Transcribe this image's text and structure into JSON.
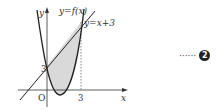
{
  "figure": {
    "curve_label": "y=f(x)",
    "line_label": "y=x+3",
    "x_axis_label": "x",
    "y_axis_label": "y",
    "origin_label": "O",
    "x_tick": "3",
    "y_tick": "3",
    "shading_color": "#d9d9d9",
    "stroke_color": "#222222"
  },
  "marker": {
    "dots": "······",
    "number": "2"
  }
}
